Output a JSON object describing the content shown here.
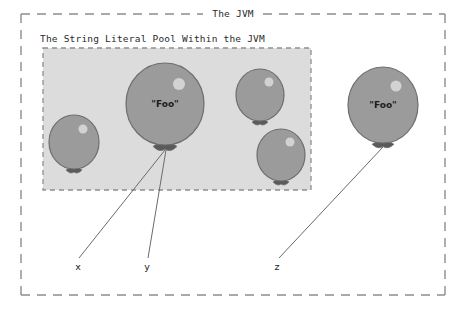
{
  "canvas": {
    "width": 465,
    "height": 310,
    "background": "#ffffff"
  },
  "colors": {
    "outer_border": "#8d8d8d",
    "pool_border": "#8f8f8f",
    "pool_fill": "#dcdcdc",
    "balloon_fill": "#9b9b9b",
    "balloon_stroke": "#6e6e6e",
    "balloon_highlight": "#d2d2d2",
    "knot": "#5a5a5a",
    "string": "#6a6a6a",
    "text": "#2b2b2b"
  },
  "jvm_box": {
    "title": "The JVM",
    "title_x": 233,
    "title_y": 17,
    "x": 21,
    "y": 14,
    "width": 424,
    "height": 281,
    "border_style": "dashed"
  },
  "pool_box": {
    "title": "The String Literal Pool Within the JVM",
    "title_x": 40,
    "title_y": 42,
    "x": 43,
    "y": 48,
    "width": 268,
    "height": 142,
    "border_style": "dashed"
  },
  "balloons": [
    {
      "id": "pool-balloon-small-left",
      "label": "",
      "cx": 74,
      "cy": 142,
      "rx": 25,
      "ry": 27,
      "highlight_dx": 9,
      "highlight_dy": -13,
      "highlight_r": 4.5,
      "knot_w": 8,
      "knot_h": 5
    },
    {
      "id": "pool-balloon-foo",
      "label": "\"Foo\"",
      "cx": 165,
      "cy": 104,
      "rx": 39,
      "ry": 41,
      "highlight_dx": 14,
      "highlight_dy": -20,
      "highlight_r": 6,
      "knot_w": 12,
      "knot_h": 7
    },
    {
      "id": "pool-balloon-small-topright",
      "label": "",
      "cx": 260,
      "cy": 95,
      "rx": 24,
      "ry": 26,
      "highlight_dx": 9,
      "highlight_dy": -13,
      "highlight_r": 4.5,
      "knot_w": 8,
      "knot_h": 5
    },
    {
      "id": "pool-balloon-small-bottomright",
      "label": "",
      "cx": 281,
      "cy": 155,
      "rx": 24,
      "ry": 26,
      "highlight_dx": 9,
      "highlight_dy": -13,
      "highlight_r": 4.5,
      "knot_w": 8,
      "knot_h": 5
    },
    {
      "id": "heap-balloon-foo",
      "label": "\"Foo\"",
      "cx": 383,
      "cy": 105,
      "rx": 35,
      "ry": 38,
      "highlight_dx": 13,
      "highlight_dy": -19,
      "highlight_r": 5.5,
      "knot_w": 11,
      "knot_h": 6
    }
  ],
  "references": [
    {
      "id": "reference-x",
      "label": "x",
      "from_x": 165,
      "from_y": 150,
      "to_x": 79,
      "to_y": 258,
      "label_x": 78,
      "label_y": 270
    },
    {
      "id": "reference-y",
      "label": "y",
      "from_x": 166,
      "from_y": 150,
      "to_x": 148,
      "to_y": 258,
      "label_x": 147,
      "label_y": 270
    },
    {
      "id": "reference-z",
      "label": "z",
      "from_x": 383,
      "from_y": 147,
      "to_x": 279,
      "to_y": 258,
      "label_x": 277,
      "label_y": 270
    }
  ]
}
